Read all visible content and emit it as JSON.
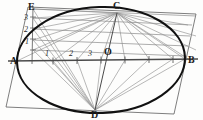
{
  "figure": {
    "background_color": "#fdfdfc",
    "ink_color": "#1a1a1a",
    "construction_color": "#8e8e8e",
    "axis_color": "#6f6f6f"
  },
  "labels": {
    "vertex_a": "A",
    "vertex_b": "B",
    "vertex_c": "C",
    "vertex_d": "D",
    "vertex_e": "E",
    "center_o": "O",
    "axis_div_1": "1",
    "axis_div_2": "2",
    "axis_div_3": "3",
    "scale_div_1": "1",
    "scale_div_2": "2",
    "scale_div_3": "3"
  },
  "geometry": {
    "ellipse": {
      "center_x": 101,
      "center_y": 60,
      "radius_x": 84,
      "radius_y": 53,
      "stroke_width": 2.0
    },
    "points": {
      "A": {
        "x": 17,
        "y": 61
      },
      "B": {
        "x": 185,
        "y": 60
      },
      "C": {
        "x": 117,
        "y": 13
      },
      "D": {
        "x": 95,
        "y": 110
      },
      "E": {
        "x": 36,
        "y": 9
      },
      "O": {
        "x": 101,
        "y": 60
      }
    },
    "parallelogram": [
      {
        "x": 28,
        "y": 7
      },
      {
        "x": 196,
        "y": 14
      },
      {
        "x": 174,
        "y": 114
      },
      {
        "x": 6,
        "y": 107
      }
    ],
    "major_axis": {
      "x1": 10,
      "y1": 61,
      "x2": 196,
      "y2": 59
    },
    "scale_line": {
      "x1": 33,
      "y1": 6,
      "x2": 32,
      "y2": 62
    },
    "axis_ticks_x": [
      53,
      77,
      101,
      125,
      149,
      173
    ],
    "scale_ticks_y": [
      17,
      28,
      39,
      50
    ],
    "rays_to_d_x": [
      33,
      53,
      77,
      101,
      125,
      149,
      173
    ],
    "rays_to_c_x": [
      33,
      53,
      77,
      101,
      125,
      149,
      173
    ],
    "horizontal_scale_lines_y": [
      9,
      18,
      29,
      40,
      50
    ]
  }
}
